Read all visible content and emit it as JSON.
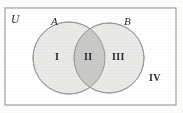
{
  "figure": {
    "kind": "venn-diagram",
    "universe_label": "U",
    "set_a_label": "A",
    "set_b_label": "B",
    "regions": [
      {
        "id": "i",
        "label": "I",
        "meaning": "A only"
      },
      {
        "id": "ii",
        "label": "II",
        "meaning": "A and B"
      },
      {
        "id": "iii",
        "label": "III",
        "meaning": "B only"
      },
      {
        "id": "iv",
        "label": "IV",
        "meaning": "outside A and B"
      }
    ],
    "colors": {
      "background": "#fdfdfc",
      "rectangle_stroke": "#8d8d8d",
      "rectangle_fill": "#ffffff",
      "circle_fill": "#e9e9e7",
      "circle_stroke": "#9a9a98",
      "intersection_fill": "#c9c9c7",
      "label_color": "#2b2b2b"
    },
    "geometry": {
      "rect": {
        "x": 5,
        "y": 8,
        "width": 171,
        "height": 97
      },
      "circle_a": {
        "cx": 69,
        "cy": 58,
        "r": 36
      },
      "circle_b": {
        "cx": 109,
        "cy": 58,
        "r": 35
      }
    }
  }
}
